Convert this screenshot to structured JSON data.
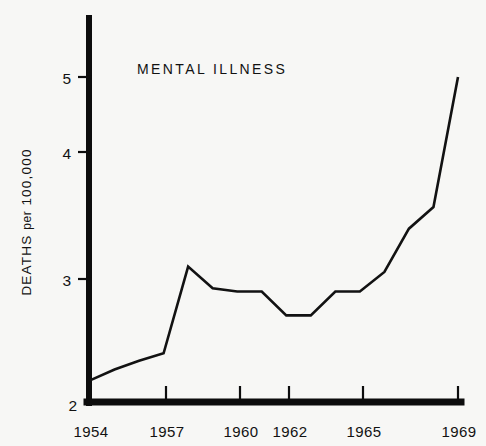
{
  "chart_data": {
    "type": "line",
    "title": "MENTAL ILLNESS",
    "xlabel": "",
    "ylabel": "DEATHS per 100,000",
    "ylabel_parts": {
      "lead": "DEATHS",
      "mid": "per",
      "tail": "100,000"
    },
    "x": [
      1954,
      1955,
      1956,
      1957,
      1958,
      1959,
      1960,
      1961,
      1962,
      1963,
      1964,
      1965,
      1966,
      1967,
      1968,
      1969
    ],
    "values": [
      2.2,
      2.3,
      2.38,
      2.45,
      3.25,
      3.05,
      3.02,
      3.02,
      2.8,
      2.8,
      3.02,
      3.02,
      3.2,
      3.6,
      3.8,
      5.0
    ],
    "series": [
      {
        "name": "MENTAL ILLNESS",
        "values": [
          2.2,
          2.3,
          2.38,
          2.45,
          3.25,
          3.05,
          3.02,
          3.02,
          2.8,
          2.8,
          3.02,
          3.02,
          3.2,
          3.6,
          3.8,
          5.0
        ]
      }
    ],
    "xlim": [
      1954,
      1969
    ],
    "ylim": [
      2,
      5.45
    ],
    "xticks": [
      1954,
      1957,
      1960,
      1962,
      1965,
      1969
    ],
    "xtick_labels": [
      "1954",
      "1957",
      "1960",
      "1962",
      "1965",
      "1969"
    ],
    "yticks": [
      2,
      3,
      4,
      5
    ],
    "ytick_labels": [
      "2",
      "3",
      "4",
      "5"
    ],
    "grid": false,
    "legend": false,
    "line_color": "#121212",
    "axis_color": "#0d0d0d",
    "background_color": "#f7f7f5"
  },
  "axis": {
    "y_tick_labels": [
      "5",
      "4",
      "3",
      "2"
    ],
    "x_tick_labels": [
      "1954",
      "1957",
      "1960",
      "1962",
      "1965",
      "1969"
    ]
  },
  "title": {
    "text": "MENTAL ILLNESS"
  }
}
